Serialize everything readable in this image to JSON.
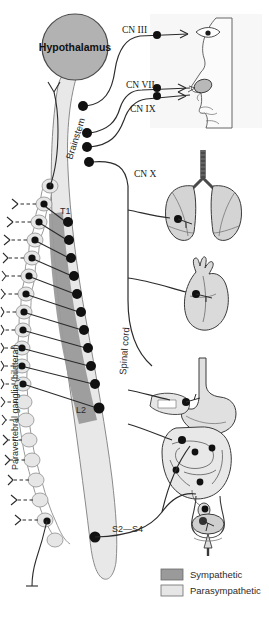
{
  "figure": {
    "title_region": "autonomic-nervous-system-diagram",
    "colors": {
      "sympathetic": "#9a9a9a",
      "parasympathetic": "#e2e2e2",
      "hypothalamus": "#b0b0b0",
      "organ_fill": "#d6d6d6",
      "head_fill": "#f2f2f2",
      "node": "#111111",
      "line": "#2b2b2b",
      "background": "#ffffff"
    }
  },
  "labels": {
    "hypothalamus": "Hypothalamus",
    "brainstem": "Brainstem",
    "spinal_cord": "Spinal cord",
    "paravertebral": "Paravertebral ganglia (bilateral)",
    "cn3": "CN III",
    "cn7": "CN VII",
    "cn9": "CN IX",
    "cn10": "CN X",
    "t1": "T1",
    "l2": "L2",
    "s2s4": "S2—S4"
  },
  "legend": {
    "items": [
      {
        "label": "Sympathetic",
        "color": "#9a9a9a"
      },
      {
        "label": "Parasympathetic",
        "color": "#e6e6e6"
      }
    ]
  },
  "organs": [
    {
      "name": "head-profile",
      "label": ""
    },
    {
      "name": "eye",
      "label": ""
    },
    {
      "name": "salivary-gland",
      "label": ""
    },
    {
      "name": "lungs",
      "label": ""
    },
    {
      "name": "heart",
      "label": ""
    },
    {
      "name": "stomach",
      "label": ""
    },
    {
      "name": "intestines",
      "label": ""
    },
    {
      "name": "bladder",
      "label": ""
    }
  ],
  "sympathetic_nodes_y": [
    222,
    240,
    258,
    276,
    294,
    312,
    330,
    348,
    366,
    384,
    408
  ],
  "ganglia_y": [
    203,
    222,
    240,
    258,
    276,
    294,
    312,
    330,
    348,
    366,
    384,
    402,
    420,
    440,
    460,
    480,
    500,
    520,
    540
  ],
  "cranial_nodes_y": [
    105,
    133,
    147,
    162
  ]
}
